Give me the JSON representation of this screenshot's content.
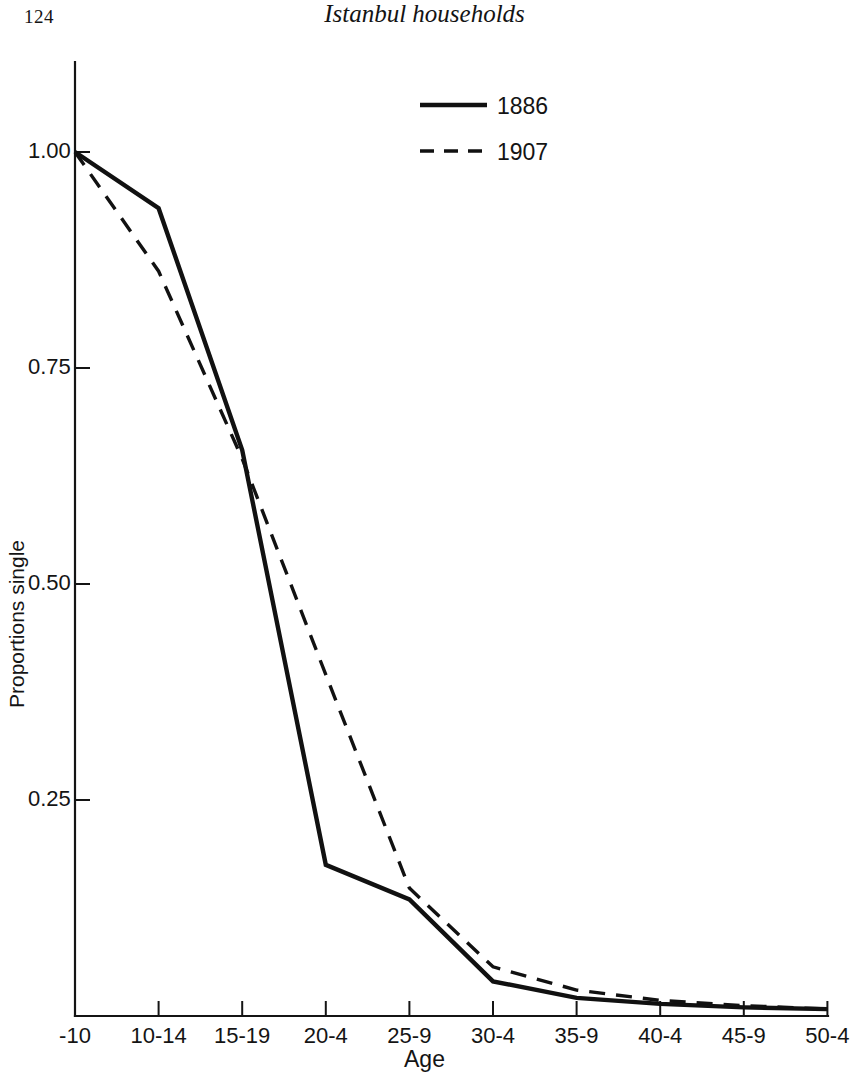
{
  "page": {
    "folio": "124",
    "running_title": "Istanbul households"
  },
  "chart_data": {
    "type": "line",
    "title": "",
    "xlabel": "Age",
    "ylabel": "Proportions single",
    "categories": [
      "-10",
      "10-14",
      "15-19",
      "20-4",
      "25-9",
      "30-4",
      "35-9",
      "40-4",
      "45-9",
      "50-4"
    ],
    "ylim": [
      0.0,
      1.06
    ],
    "yticks": [
      0.25,
      0.5,
      0.75,
      1.0
    ],
    "ytick_labels": [
      "0.25",
      "0.50",
      "0.75",
      "1.00"
    ],
    "grid": false,
    "legend_position": "top-center",
    "series": [
      {
        "name": "1886",
        "style": "solid",
        "color": "#111111",
        "values": [
          1.0,
          0.935,
          0.655,
          0.175,
          0.135,
          0.04,
          0.021,
          0.014,
          0.01,
          0.008
        ]
      },
      {
        "name": "1907",
        "style": "dashed",
        "color": "#111111",
        "values": [
          1.0,
          0.862,
          0.645,
          0.395,
          0.148,
          0.057,
          0.03,
          0.018,
          0.012,
          0.008
        ]
      }
    ]
  },
  "legend": {
    "entries": [
      {
        "label": "1886",
        "style": "solid"
      },
      {
        "label": "1907",
        "style": "dashed"
      }
    ]
  }
}
